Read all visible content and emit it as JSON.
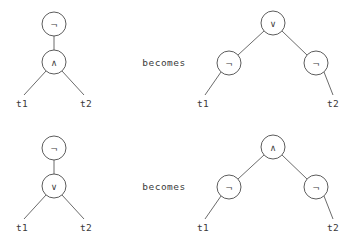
{
  "figure": {
    "background_color": "#ffffff",
    "stroke_color": "#4a4a4a",
    "text_color": "#3a3a3a",
    "connector_label": "becomes"
  },
  "symbols": {
    "negation": "¬",
    "conjunction": "∧",
    "disjunction": "∨"
  },
  "rules": [
    {
      "id": "rule-1",
      "connector": "becomes",
      "left": {
        "id": "tree-1-left",
        "root": {
          "label": "¬",
          "name": "not-node",
          "cx": 54,
          "cy": 24,
          "r": 12,
          "children": [
            {
              "label": "∧",
              "name": "and-node",
              "cx": 54,
              "cy": 62,
              "r": 12,
              "children": [
                {
                  "label": "t1",
                  "name": "leaf-t1",
                  "x": 22,
                  "y": 103
                },
                {
                  "label": "t2",
                  "name": "leaf-t2",
                  "x": 86,
                  "y": 103
                }
              ]
            }
          ]
        }
      },
      "right": {
        "id": "tree-1-right",
        "root": {
          "label": "∨",
          "name": "or-node",
          "cx": 273,
          "cy": 23,
          "r": 12,
          "children": [
            {
              "label": "¬",
              "name": "not-node-left",
              "cx": 229,
              "cy": 63,
              "r": 12,
              "children": [
                {
                  "label": "t1",
                  "name": "leaf-t1",
                  "x": 203,
                  "y": 103
                }
              ]
            },
            {
              "label": "¬",
              "name": "not-node-right",
              "cx": 316,
              "cy": 63,
              "r": 12,
              "children": [
                {
                  "label": "t2",
                  "name": "leaf-t2",
                  "x": 333,
                  "y": 103
                }
              ]
            }
          ]
        }
      },
      "connector_pos": {
        "x": 164,
        "y": 62
      }
    },
    {
      "id": "rule-2",
      "connector": "becomes",
      "left": {
        "id": "tree-2-left",
        "root": {
          "label": "¬",
          "name": "not-node",
          "cx": 54,
          "cy": 148,
          "r": 12,
          "children": [
            {
              "label": "∨",
              "name": "or-node",
              "cx": 54,
              "cy": 186,
              "r": 12,
              "children": [
                {
                  "label": "t1",
                  "name": "leaf-t1",
                  "x": 22,
                  "y": 227
                },
                {
                  "label": "t2",
                  "name": "leaf-t2",
                  "x": 86,
                  "y": 227
                }
              ]
            }
          ]
        }
      },
      "right": {
        "id": "tree-2-right",
        "root": {
          "label": "∧",
          "name": "and-node",
          "cx": 273,
          "cy": 147,
          "r": 12,
          "children": [
            {
              "label": "¬",
              "name": "not-node-left",
              "cx": 229,
              "cy": 187,
              "r": 12,
              "children": [
                {
                  "label": "t1",
                  "name": "leaf-t1",
                  "x": 203,
                  "y": 227
                }
              ]
            },
            {
              "label": "¬",
              "name": "not-node-right",
              "cx": 316,
              "cy": 187,
              "r": 12,
              "children": [
                {
                  "label": "t2",
                  "name": "leaf-t2",
                  "x": 333,
                  "y": 227
                }
              ]
            }
          ]
        }
      },
      "connector_pos": {
        "x": 164,
        "y": 186
      }
    }
  ]
}
